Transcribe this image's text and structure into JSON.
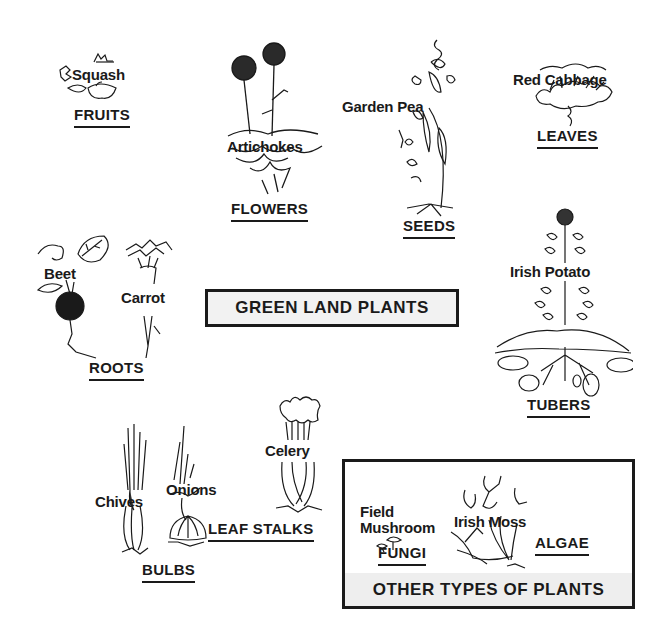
{
  "diagram": {
    "central_title": "GREEN LAND PLANTS",
    "categories": [
      {
        "name": "FRUITS",
        "examples": [
          "Squash"
        ]
      },
      {
        "name": "FLOWERS",
        "examples": [
          "Artichokes"
        ]
      },
      {
        "name": "SEEDS",
        "examples": [
          "Garden Pea"
        ]
      },
      {
        "name": "LEAVES",
        "examples": [
          "Red Cabbage"
        ]
      },
      {
        "name": "ROOTS",
        "examples": [
          "Beet",
          "Carrot"
        ]
      },
      {
        "name": "TUBERS",
        "examples": [
          "Irish Potato"
        ]
      },
      {
        "name": "BULBS",
        "examples": [
          "Chives",
          "Onions"
        ]
      },
      {
        "name": "LEAF STALKS",
        "examples": [
          "Celery"
        ]
      }
    ],
    "other_box": {
      "title": "OTHER TYPES OF PLANTS",
      "categories": [
        {
          "name": "FUNGI",
          "examples": [
            "Field Mushroom"
          ]
        },
        {
          "name": "ALGAE",
          "examples": [
            "Irish Moss"
          ]
        }
      ]
    }
  },
  "labels": {
    "squash": "Squash",
    "fruits": "FRUITS",
    "artichokes": "Artichokes",
    "flowers": "FLOWERS",
    "garden_pea": "Garden Pea",
    "seeds": "SEEDS",
    "red_cabbage": "Red Cabbage",
    "leaves": "LEAVES",
    "beet": "Beet",
    "carrot": "Carrot",
    "roots": "ROOTS",
    "irish_potato": "Irish Potato",
    "tubers": "TUBERS",
    "chives": "Chives",
    "onions": "Onions",
    "bulbs": "BULBS",
    "celery": "Celery",
    "leaf_stalks": "LEAF STALKS",
    "field_mushroom_line1": "Field",
    "field_mushroom_line2": "Mushroom",
    "fungi": "FUNGI",
    "irish_moss": "Irish Moss",
    "algae": "ALGAE",
    "green_land_plants": "GREEN LAND PLANTS",
    "other_types": "OTHER TYPES OF PLANTS"
  },
  "colors": {
    "ink": "#1a1a1a",
    "background": "#ffffff",
    "box_fill": "#f2f2f2"
  }
}
